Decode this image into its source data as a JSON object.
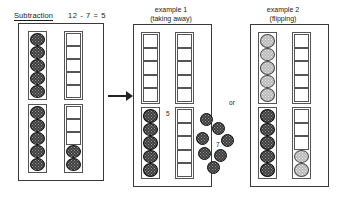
{
  "title": {
    "label": "Subtraction",
    "equation": "12 - 7 = 5"
  },
  "examples": [
    {
      "heading_line1": "example 1",
      "heading_line2": "(taking away)"
    },
    {
      "heading_line1": "example 2",
      "heading_line2": "(flipping)"
    }
  ],
  "annotations": {
    "result_label": "5",
    "removed_label": "7",
    "or_label": "or"
  },
  "colors": {
    "counter_dark": "#3d3d3d",
    "counter_light": "#b9b9b9",
    "outline": "#555555",
    "panel_border": "#3a3a3a",
    "text": "#1a1a1a",
    "background": "#ffffff"
  },
  "panels": {
    "source": {
      "name": "starting-amount",
      "columns": [
        {
          "name": "column-left",
          "groups": [
            {
              "cells": [
                "dark",
                "dark",
                "dark",
                "dark",
                "dark"
              ]
            },
            {
              "cells": [
                "dark",
                "dark",
                "dark",
                "dark",
                "dark"
              ]
            }
          ]
        },
        {
          "name": "column-right",
          "groups": [
            {
              "cells": [
                "empty",
                "empty",
                "empty",
                "empty",
                "empty"
              ]
            },
            {
              "cells": [
                "empty",
                "empty",
                "empty",
                "dark",
                "dark"
              ]
            }
          ]
        }
      ]
    },
    "example1": {
      "name": "taking-away",
      "columns": [
        {
          "name": "column-left",
          "groups": [
            {
              "cells": [
                "empty",
                "empty",
                "empty",
                "empty",
                "empty"
              ]
            },
            {
              "cells": [
                "dark",
                "dark",
                "dark",
                "dark",
                "dark"
              ]
            }
          ]
        },
        {
          "name": "column-right",
          "groups": [
            {
              "cells": [
                "empty",
                "empty",
                "empty",
                "empty",
                "empty"
              ]
            },
            {
              "cells": [
                "empty",
                "empty",
                "empty",
                "empty",
                "empty"
              ]
            }
          ]
        }
      ]
    },
    "example2": {
      "name": "flipping",
      "columns": [
        {
          "name": "column-left",
          "groups": [
            {
              "cells": [
                "light",
                "light",
                "light",
                "light",
                "light"
              ]
            },
            {
              "cells": [
                "dark",
                "dark",
                "dark",
                "dark",
                "dark"
              ]
            }
          ]
        },
        {
          "name": "column-right",
          "groups": [
            {
              "cells": [
                "empty",
                "empty",
                "empty",
                "empty",
                "empty"
              ]
            },
            {
              "cells": [
                "empty",
                "empty",
                "empty",
                "light",
                "light"
              ]
            }
          ]
        }
      ]
    }
  },
  "loose_counters": {
    "count": 7,
    "positions": [
      {
        "x": 200,
        "y": 113
      },
      {
        "x": 212,
        "y": 122
      },
      {
        "x": 196,
        "y": 132
      },
      {
        "x": 221,
        "y": 134
      },
      {
        "x": 198,
        "y": 147
      },
      {
        "x": 214,
        "y": 149
      },
      {
        "x": 207,
        "y": 161
      }
    ]
  }
}
